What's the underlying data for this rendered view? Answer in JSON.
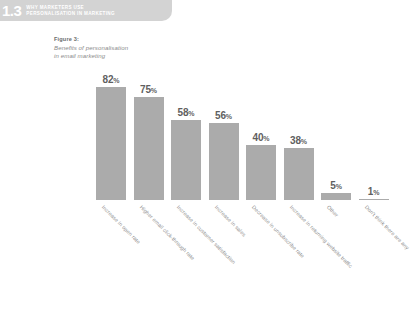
{
  "section": {
    "number": "1.3",
    "title_lines": [
      "WHY MARKETERS USE",
      "PERSONALISATION IN MARKETING"
    ],
    "banner_color": "#d3d3d3",
    "title_color": "#ffffff"
  },
  "figure": {
    "label": "Figure 3:",
    "subtitle_lines": [
      "Benefits of personalisation",
      "in email marketing"
    ]
  },
  "chart_data": {
    "type": "bar",
    "title": "Benefits of personalisation in email marketing",
    "xlabel": "",
    "ylabel": "",
    "ylim": [
      0,
      100
    ],
    "grid": false,
    "legend": false,
    "bar_color": "#ababab",
    "label_color": "#5f5f5f",
    "categories": [
      "Increase in open rate",
      "Higher email click-through rate",
      "Increase in customer satisfaction",
      "Increase in sales",
      "Decrease in unsubscribe rate",
      "Increase in returning website traffic",
      "Other",
      "Don't think there are any"
    ],
    "values": [
      82,
      75,
      58,
      56,
      40,
      38,
      5,
      1
    ],
    "value_labels": [
      "82%",
      "75%",
      "58%",
      "56%",
      "40%",
      "38%",
      "5%",
      "1%"
    ]
  }
}
